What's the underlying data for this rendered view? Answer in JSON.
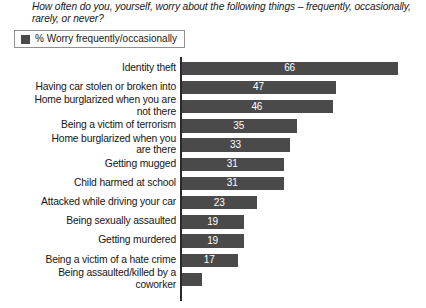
{
  "question": "How often do you, yourself, worry about the following things – frequently, occasionally, rarely, or never?",
  "legend": {
    "swatch_color": "#4a4a4a",
    "label": "% Worry frequently/occasionally"
  },
  "chart_data": {
    "type": "bar",
    "orientation": "horizontal",
    "title": "How often do you, yourself, worry about the following things – frequently, occasionally, rarely, or never?",
    "xlabel": "",
    "ylabel": "",
    "xlim": [
      0,
      72
    ],
    "grid": false,
    "legend_position": "top-left",
    "series": [
      {
        "name": "% Worry frequently/occasionally",
        "color": "#4a4a4a",
        "values": [
          66,
          47,
          46,
          35,
          33,
          31,
          31,
          23,
          19,
          19,
          17,
          6
        ]
      }
    ],
    "categories": [
      "Identity theft",
      "Having car stolen or broken into",
      "Home burglarized when you are not there",
      "Being a victim of terrorism",
      "Home burglarized when you are there",
      "Getting mugged",
      "Child harmed at school",
      "Attacked while driving your car",
      "Being sexually assaulted",
      "Getting murdered",
      "Being a victim of a hate crime",
      "Being assaulted/killed by a coworker"
    ],
    "data_labels": [
      "66",
      "47",
      "46",
      "35",
      "33",
      "31",
      "31",
      "23",
      "19",
      "19",
      "17",
      ""
    ]
  },
  "rows": [
    {
      "label": "Identity theft",
      "value": 66,
      "value_label": "66",
      "lines": 1
    },
    {
      "label": "Having car stolen or broken into",
      "value": 47,
      "value_label": "47",
      "lines": 1
    },
    {
      "label": "Home burglarized when you are\nnot there",
      "value": 46,
      "value_label": "46",
      "lines": 2
    },
    {
      "label": "Being a victim of terrorism",
      "value": 35,
      "value_label": "35",
      "lines": 1
    },
    {
      "label": "Home burglarized when you\nare there",
      "value": 33,
      "value_label": "33",
      "lines": 2
    },
    {
      "label": "Getting mugged",
      "value": 31,
      "value_label": "31",
      "lines": 1
    },
    {
      "label": "Child harmed at school",
      "value": 31,
      "value_label": "31",
      "lines": 1
    },
    {
      "label": "Attacked while driving your car",
      "value": 23,
      "value_label": "23",
      "lines": 1
    },
    {
      "label": "Being sexually assaulted",
      "value": 19,
      "value_label": "19",
      "lines": 1
    },
    {
      "label": "Getting murdered",
      "value": 19,
      "value_label": "19",
      "lines": 1
    },
    {
      "label": "Being a victim of a hate crime",
      "value": 17,
      "value_label": "17",
      "lines": 1
    },
    {
      "label": "Being assaulted/killed by a\ncoworker",
      "value": 6,
      "value_label": "",
      "lines": 2
    }
  ]
}
